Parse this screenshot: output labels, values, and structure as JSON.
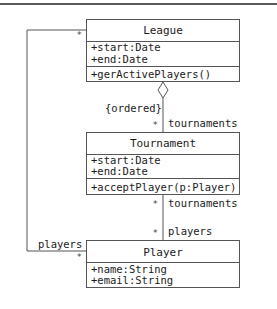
{
  "diagram": {
    "type": "uml-class-diagram",
    "classes": [
      {
        "name": "League",
        "attributes": [
          "+start:Date",
          "+end:Date"
        ],
        "operations": [
          "+gerActivePlayers()"
        ]
      },
      {
        "name": "Tournament",
        "attributes": [
          "+start:Date",
          "+end:Date"
        ],
        "operations": [
          "+acceptPlayer(p:Player)"
        ]
      },
      {
        "name": "Player",
        "attributes": [
          "+name:String",
          "+email:String"
        ],
        "operations": []
      }
    ],
    "associations": [
      {
        "from": "League",
        "to": "Tournament",
        "kind": "aggregation",
        "constraint": "{ordered}",
        "to_multiplicity": "*",
        "to_role": "tournaments"
      },
      {
        "from": "Tournament",
        "to": "Player",
        "kind": "association",
        "from_multiplicity": "*",
        "from_role": "tournaments",
        "to_multiplicity": "*",
        "to_role": "players"
      },
      {
        "from": "League",
        "to": "Player",
        "kind": "association",
        "from_multiplicity": "*",
        "to_multiplicity": "*",
        "to_role": "players"
      }
    ]
  }
}
